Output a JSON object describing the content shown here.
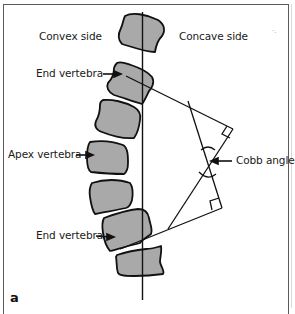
{
  "figure": {
    "panel_label": "a",
    "labels": {
      "convex_side": "Convex side",
      "concave_side": "Concave side",
      "end_vertebra_upper": "End vertebra",
      "apex_vertebra": "Apex vertebra",
      "end_vertebra_lower": "End vertebra",
      "cobb_angle": "Cobb angle"
    },
    "colors": {
      "vertebra_fill": "#a9a9a9",
      "outline": "#111111",
      "frame": "#5a5a5a"
    },
    "vertebra_count": 7,
    "right_angle_markers": 2
  }
}
